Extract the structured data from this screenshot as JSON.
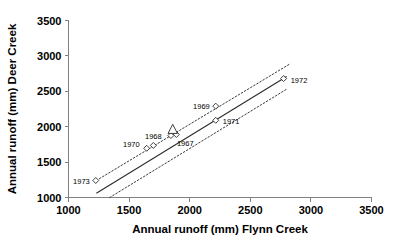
{
  "chart_data": {
    "type": "scatter",
    "title": "",
    "xlabel": "Annual runoff (mm) Flynn Creek",
    "ylabel": "Annual runoff (mm) Deer Creek",
    "xlim": [
      1000,
      3500
    ],
    "ylim": [
      1000,
      3500
    ],
    "xticks": [
      1000,
      1500,
      2000,
      2500,
      3000,
      3500
    ],
    "yticks": [
      1000,
      1500,
      2000,
      2500,
      3000,
      3500
    ],
    "xtick_labels": [
      "1000",
      "1500",
      "2000",
      "2500",
      "3000",
      "3500"
    ],
    "ytick_labels": [
      "1000",
      "1500",
      "2000",
      "2500",
      "3000",
      "3500"
    ],
    "grid": false,
    "legend": "none",
    "marker_style": "open diamond",
    "points": [
      {
        "label": "1973",
        "x": 1225,
        "y": 1240,
        "marker": "diamond",
        "label_pos": "left"
      },
      {
        "label": "1970",
        "x": 1645,
        "y": 1695,
        "marker": "diamond",
        "label_pos": "left-above"
      },
      {
        "label": "1968",
        "x": 1700,
        "y": 1735,
        "marker": "diamond",
        "label_pos": "above"
      },
      {
        "label": "1967",
        "x": 1845,
        "y": 1875,
        "marker": "diamond",
        "label_pos": "below-right"
      },
      {
        "label": "",
        "x": 1890,
        "y": 1890,
        "marker": "diamond",
        "label_pos": "none"
      },
      {
        "label": "",
        "x": 1860,
        "y": 1960,
        "marker": "triangle",
        "label_pos": "none"
      },
      {
        "label": "1969",
        "x": 2215,
        "y": 2290,
        "marker": "diamond",
        "label_pos": "left"
      },
      {
        "label": "1971",
        "x": 2215,
        "y": 2090,
        "marker": "diamond",
        "label_pos": "right"
      },
      {
        "label": "1972",
        "x": 2775,
        "y": 2680,
        "marker": "diamond",
        "label_pos": "right"
      }
    ],
    "fit_line": {
      "style": "solid",
      "x0": 1230,
      "y0": 1060,
      "x1": 2800,
      "y1": 2710
    },
    "confidence_bands": [
      {
        "name": "upper",
        "style": "dotted",
        "x0": 1230,
        "y0": 1240,
        "x1": 2830,
        "y1": 2890
      },
      {
        "name": "lower",
        "style": "dotted",
        "x0": 1340,
        "y0": 1000,
        "x1": 2800,
        "y1": 2530
      }
    ],
    "colors": {
      "axis": "#808080",
      "line": "#2b2b2b",
      "band": "#3a3a3a",
      "marker_fill": "#ffffff",
      "text": "#000000",
      "background": "#ffffff"
    }
  }
}
